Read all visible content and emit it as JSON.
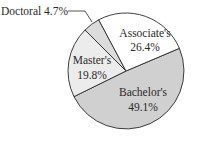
{
  "chart_data": {
    "type": "pie",
    "title": "",
    "slices": [
      {
        "label": "Bachelor's",
        "value": 49.1,
        "display": "49.1%",
        "color": "#d0d0d0"
      },
      {
        "label": "Master's",
        "value": 19.8,
        "display": "19.8%",
        "color": "#ececec"
      },
      {
        "label": "Doctoral",
        "value": 4.7,
        "display": "4.7%",
        "color": "#dcdcdc"
      },
      {
        "label": "Associate's",
        "value": 26.4,
        "display": "26.4%",
        "color": "#ffffff"
      }
    ],
    "start_angle_deg": -23,
    "direction": "clockwise",
    "legend": "none"
  },
  "labels": {
    "associates_name": "Associate's",
    "associates_value": "26.4%",
    "bachelors_name": "Bachelor's",
    "bachelors_value": "49.1%",
    "masters_name": "Master's",
    "masters_value": "19.8%",
    "doctoral_callout": "Doctoral 4.7%"
  }
}
